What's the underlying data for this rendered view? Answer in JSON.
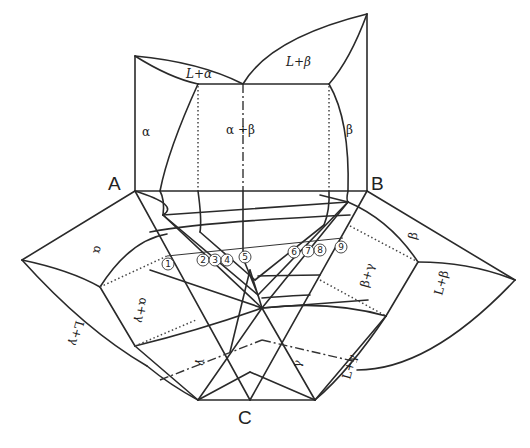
{
  "diagram": {
    "type": "ternary-eutectic-phase-diagram-unfolded",
    "vertices": {
      "a": "A",
      "b": "B",
      "c": "C"
    },
    "top_panel": {
      "regions": {
        "alpha": "α",
        "l_alpha": "L+α",
        "alpha_beta": "α +β",
        "l_beta": "L+β",
        "beta": "β"
      }
    },
    "left_panel": {
      "regions": {
        "alpha": "α",
        "alpha_gamma": "α+γ",
        "l_alpha": "L+α",
        "gamma": "γ",
        "l_gamma": "L+γ"
      }
    },
    "right_panel": {
      "regions": {
        "beta": "β",
        "beta_gamma": "β+γ",
        "l_beta": "L+β",
        "gamma": "γ",
        "l_gamma": "L+γ"
      }
    },
    "section_markers": [
      "①",
      "②",
      "③",
      "④",
      "⑤",
      "⑥",
      "⑦",
      "⑧",
      "⑨"
    ],
    "section_marker_numbers": [
      "1",
      "2",
      "3",
      "4",
      "5",
      "6",
      "7",
      "8",
      "9"
    ]
  }
}
